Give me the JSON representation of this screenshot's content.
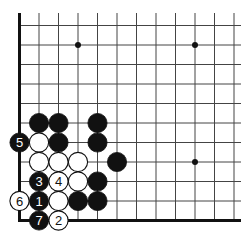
{
  "diagram": {
    "type": "go-board-corner",
    "corner": "bottom-left",
    "grid": {
      "origin_x": 19.5,
      "origin_y": 220.5,
      "spacing": 19.5,
      "cols": 12,
      "rows": 11,
      "line_color": "#444444",
      "edge_color": "#111111"
    },
    "hoshi": [
      {
        "col": 3,
        "row": 9
      },
      {
        "col": 9,
        "row": 9
      },
      {
        "col": 9,
        "row": 3
      }
    ],
    "stones": [
      {
        "color": "black",
        "col": 1,
        "row": 5,
        "label": ""
      },
      {
        "color": "black",
        "col": 2,
        "row": 5,
        "label": ""
      },
      {
        "color": "black",
        "col": 4,
        "row": 5,
        "label": ""
      },
      {
        "color": "black",
        "col": 0,
        "row": 4,
        "label": "5"
      },
      {
        "color": "white",
        "col": 1,
        "row": 4,
        "label": ""
      },
      {
        "color": "black",
        "col": 2,
        "row": 4,
        "label": ""
      },
      {
        "color": "black",
        "col": 4,
        "row": 4,
        "label": ""
      },
      {
        "color": "white",
        "col": 1,
        "row": 3,
        "label": ""
      },
      {
        "color": "white",
        "col": 2,
        "row": 3,
        "label": ""
      },
      {
        "color": "white",
        "col": 3,
        "row": 3,
        "label": ""
      },
      {
        "color": "black",
        "col": 5,
        "row": 3,
        "label": ""
      },
      {
        "color": "black",
        "col": 1,
        "row": 2,
        "label": "3"
      },
      {
        "color": "white",
        "col": 2,
        "row": 2,
        "label": "4"
      },
      {
        "color": "white",
        "col": 3,
        "row": 2,
        "label": ""
      },
      {
        "color": "black",
        "col": 4,
        "row": 2,
        "label": ""
      },
      {
        "color": "white",
        "col": 0,
        "row": 1,
        "label": "6"
      },
      {
        "color": "black",
        "col": 1,
        "row": 1,
        "label": "1"
      },
      {
        "color": "white",
        "col": 2,
        "row": 1,
        "label": ""
      },
      {
        "color": "black",
        "col": 3,
        "row": 1,
        "label": ""
      },
      {
        "color": "black",
        "col": 4,
        "row": 1,
        "label": ""
      },
      {
        "color": "black",
        "col": 1,
        "row": 0,
        "label": "7"
      },
      {
        "color": "white",
        "col": 2,
        "row": 0,
        "label": "2"
      }
    ]
  }
}
